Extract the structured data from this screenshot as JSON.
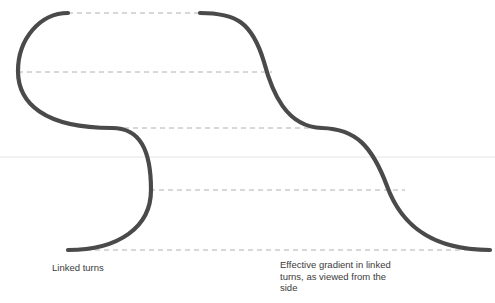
{
  "figure": {
    "title_left": "Linked turns",
    "title_right": "Effective gradient in linked turns, as viewed from the side",
    "colors": {
      "track_stroke": "#4a4a4a",
      "dashed_guide": "#b0b0b0",
      "horizon_line": "#e4e4e4",
      "background": "#ffffff",
      "text": "#3b3b3b"
    }
  },
  "chart_data": {
    "type": "line",
    "xlabel": "",
    "ylabel": "",
    "grid": true,
    "legend": "none",
    "xlim": [
      0,
      495
    ],
    "ylim": [
      0,
      303
    ],
    "annotations": [
      {
        "name": "plan-view-label",
        "text": "Linked turns",
        "x": 52,
        "y": 268
      },
      {
        "name": "side-view-label",
        "text": "Effective gradient in linked turns, as viewed from the side",
        "x": 280,
        "y": 265
      }
    ],
    "guide_lines": [
      {
        "name": "guide-level-1",
        "y": 13,
        "x_start": 68,
        "x_end": 200,
        "style": "dashed"
      },
      {
        "name": "guide-level-2",
        "y": 72,
        "x_start": 18,
        "x_end": 272,
        "style": "dashed"
      },
      {
        "name": "guide-level-3",
        "y": 128,
        "x_start": 115,
        "x_end": 330,
        "style": "dashed"
      },
      {
        "name": "guide-level-4",
        "y": 190,
        "x_start": 150,
        "x_end": 405,
        "style": "dashed"
      },
      {
        "name": "guide-level-5",
        "y": 250,
        "x_start": 68,
        "x_end": 490,
        "style": "dashed"
      },
      {
        "name": "horizon",
        "y": 157,
        "x_start": 0,
        "x_end": 495,
        "style": "solid-faint"
      }
    ],
    "series": [
      {
        "name": "linked-turns-plan-view",
        "description": "Two stacked 180-degree turns forming an S in plan view",
        "path": "M 68 13 C 40 13 18 40 18 72 C 18 104 40 128 115 128 C 150 128 150 152 150 190 C 150 226 118 250 68 250",
        "points": [
          {
            "x": 68,
            "y": 13
          },
          {
            "x": 18,
            "y": 72
          },
          {
            "x": 115,
            "y": 128
          },
          {
            "x": 150,
            "y": 190
          },
          {
            "x": 68,
            "y": 250
          }
        ]
      },
      {
        "name": "effective-gradient-side-view",
        "description": "Descending stepped S-curve showing gradient across linked turns",
        "path": "M 200 13 C 240 13 255 25 268 72 C 281 118 292 128 330 128 C 368 128 375 150 390 190 C 404 228 430 250 490 250",
        "points": [
          {
            "x": 200,
            "y": 13
          },
          {
            "x": 268,
            "y": 72
          },
          {
            "x": 330,
            "y": 128
          },
          {
            "x": 390,
            "y": 190
          },
          {
            "x": 490,
            "y": 250
          }
        ]
      }
    ]
  }
}
